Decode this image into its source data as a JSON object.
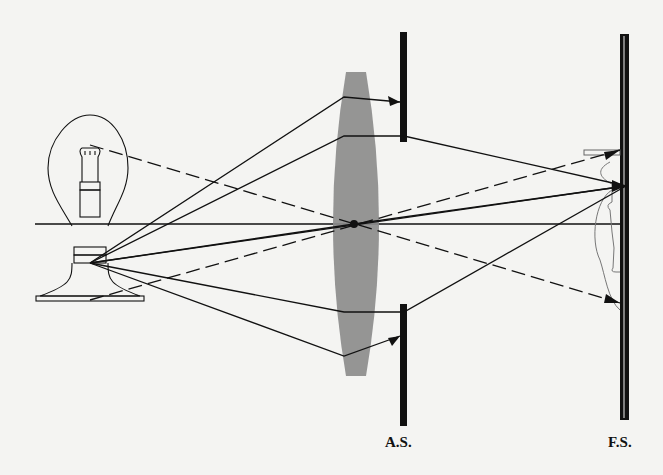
{
  "diagram": {
    "type": "optical-ray-diagram",
    "elements": {
      "source": "light-bulb",
      "lens": "biconvex-lens",
      "aperture_stop": "A.S.",
      "field_stop": "F.S.",
      "image": "inverted-light-bulb-image"
    },
    "labels": {
      "aperture_stop": "A.S.",
      "field_stop": "F.S."
    },
    "colors": {
      "background": "#f4f4f2",
      "lens_fill": "#8c8c8c",
      "lines": "#111111",
      "image_outline": "#777777"
    },
    "rays": {
      "solid_description": "Rays from base of bulb fanning through lens to image point on field stop; marginal rays blocked by aperture stop",
      "dashed_description": "Chief rays from top and bottom of bulb passing through lens center"
    }
  }
}
